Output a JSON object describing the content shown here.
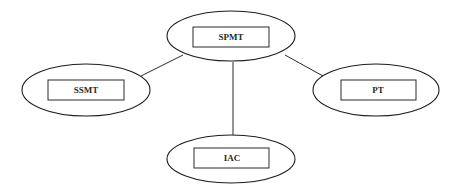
{
  "diagram": {
    "type": "hub-and-spoke",
    "nodes": [
      {
        "id": "spmt",
        "label": "SPMT",
        "role": "center"
      },
      {
        "id": "ssmt",
        "label": "SSMT",
        "role": "left"
      },
      {
        "id": "pt",
        "label": "PT",
        "role": "right"
      },
      {
        "id": "iac",
        "label": "IAC",
        "role": "bottom"
      }
    ],
    "edges": [
      {
        "from": "SPMT",
        "to": "SSMT"
      },
      {
        "from": "SPMT",
        "to": "PT"
      },
      {
        "from": "SPMT",
        "to": "IAC"
      }
    ]
  }
}
